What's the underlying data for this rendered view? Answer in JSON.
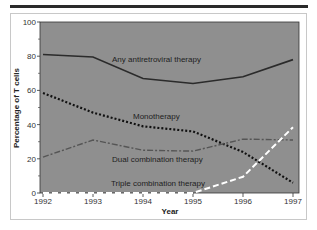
{
  "chart_data": {
    "type": "line",
    "title": "",
    "xlabel": "Year",
    "ylabel": "Percentage of T cells",
    "x": [
      1992,
      1993,
      1994,
      1995,
      1996,
      1997
    ],
    "ylim": [
      0,
      100
    ],
    "yticks": [
      0,
      20,
      40,
      60,
      80,
      100
    ],
    "xticks": [
      "1992",
      "1993",
      "1994",
      "1995",
      "1996",
      "1997"
    ],
    "grid": false,
    "legend": "inline annotations",
    "plot_background": "#8f8f8f",
    "series": [
      {
        "name": "Any antiretroviral therapy",
        "style": "solid",
        "color": "#2b2b2b",
        "values": [
          81,
          79.5,
          67,
          64,
          68,
          78
        ]
      },
      {
        "name": "Monotherapy",
        "style": "dotted",
        "color": "#111111",
        "values": [
          58.5,
          47,
          39,
          36,
          24,
          6
        ]
      },
      {
        "name": "Dual combination therapy",
        "style": "dash-dot",
        "color": "#555555",
        "values": [
          21,
          31,
          25,
          24.5,
          31.5,
          31
        ]
      },
      {
        "name": "Triple combination therapy",
        "style": "dashed",
        "color": "#ffffff",
        "values": [
          0,
          0,
          0,
          0,
          9.5,
          38.5
        ]
      }
    ]
  }
}
